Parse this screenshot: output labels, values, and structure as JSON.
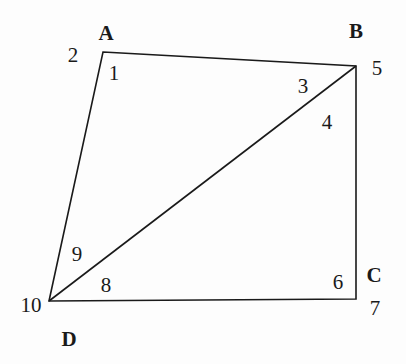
{
  "figure": {
    "type": "geometry-diagram",
    "background_color": "#fdfdfd",
    "stroke_color": "#1a1a1a",
    "stroke_width": 1.6,
    "canvas": {
      "width": 406,
      "height": 364
    },
    "vertices": [
      {
        "name": "A",
        "x": 103,
        "y": 52
      },
      {
        "name": "B",
        "x": 356,
        "y": 66
      },
      {
        "name": "C",
        "x": 356,
        "y": 299
      },
      {
        "name": "D",
        "x": 49,
        "y": 301
      }
    ],
    "edges": [
      {
        "name": "AB",
        "from": "A",
        "to": "B"
      },
      {
        "name": "BC",
        "from": "B",
        "to": "C"
      },
      {
        "name": "CD",
        "from": "C",
        "to": "D"
      },
      {
        "name": "DA",
        "from": "D",
        "to": "A"
      },
      {
        "name": "DB-diagonal",
        "from": "D",
        "to": "B"
      }
    ],
    "vertex_labels": [
      {
        "id": "A",
        "text": "A",
        "x": 106,
        "y": 33
      },
      {
        "id": "B",
        "text": "B",
        "x": 356,
        "y": 31
      },
      {
        "id": "C",
        "text": "C",
        "x": 374,
        "y": 275
      },
      {
        "id": "D",
        "text": "D",
        "x": 69,
        "y": 339
      }
    ],
    "angle_labels": [
      {
        "id": "1",
        "text": "1",
        "x": 114,
        "y": 73,
        "at_vertex": "A",
        "region": "interior-triangle-ABD"
      },
      {
        "id": "2",
        "text": "2",
        "x": 73,
        "y": 55,
        "at_vertex": "A",
        "region": "exterior-left-of-A"
      },
      {
        "id": "3",
        "text": "3",
        "x": 303,
        "y": 86,
        "at_vertex": "B",
        "region": "interior-triangle-ABD"
      },
      {
        "id": "4",
        "text": "4",
        "x": 327,
        "y": 122,
        "at_vertex": "B",
        "region": "interior-triangle-DBC"
      },
      {
        "id": "5",
        "text": "5",
        "x": 377,
        "y": 68,
        "at_vertex": "B",
        "region": "exterior-right-of-B"
      },
      {
        "id": "6",
        "text": "6",
        "x": 338,
        "y": 282,
        "at_vertex": "C",
        "region": "interior-triangle-DBC"
      },
      {
        "id": "7",
        "text": "7",
        "x": 375,
        "y": 308,
        "at_vertex": "C",
        "region": "exterior-right-of-C"
      },
      {
        "id": "8",
        "text": "8",
        "x": 106,
        "y": 285,
        "at_vertex": "D",
        "region": "interior-triangle-DBC"
      },
      {
        "id": "9",
        "text": "9",
        "x": 77,
        "y": 254,
        "at_vertex": "D",
        "region": "interior-triangle-ABD"
      },
      {
        "id": "10",
        "text": "10",
        "x": 31,
        "y": 305,
        "at_vertex": "D",
        "region": "exterior-left-of-D"
      }
    ]
  }
}
